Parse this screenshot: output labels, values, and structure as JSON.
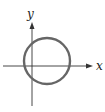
{
  "diagram": {
    "type": "coordinate-plane-with-circle",
    "axes": {
      "x_label": "x",
      "y_label": "y",
      "color": "#333333"
    },
    "circle": {
      "cx": 47,
      "cy": 61,
      "r": 23,
      "stroke": "#666666",
      "stroke_width": 2.4
    }
  }
}
